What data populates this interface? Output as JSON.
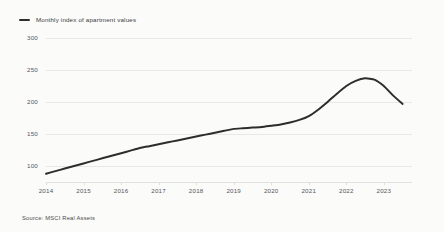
{
  "chart_data": {
    "type": "line",
    "title": "",
    "subtitle": "",
    "xlabel": "",
    "ylabel": "",
    "grid": true,
    "legend_position": "top-left",
    "legend": [
      "Monthly index of apartment values"
    ],
    "ylim": [
      75,
      300
    ],
    "yticks": [
      100,
      150,
      200,
      250,
      300
    ],
    "ytick_labels": [
      "100",
      "150",
      "200",
      "250",
      "300"
    ],
    "xlim": [
      2014,
      2023.75
    ],
    "xticks": [
      2014,
      2015,
      2016,
      2017,
      2018,
      2019,
      2020,
      2021,
      2022,
      2023
    ],
    "xtick_labels": [
      "2014",
      "2015",
      "2016",
      "2017",
      "2018",
      "2019",
      "2020",
      "2021",
      "2022",
      "2023"
    ],
    "series": [
      {
        "name": "Monthly index of apartment values",
        "color": "#2d2d2d",
        "x": [
          2014.0,
          2014.25,
          2014.5,
          2014.75,
          2015.0,
          2015.25,
          2015.5,
          2015.75,
          2016.0,
          2016.25,
          2016.5,
          2016.75,
          2017.0,
          2017.25,
          2017.5,
          2017.75,
          2018.0,
          2018.25,
          2018.5,
          2018.75,
          2019.0,
          2019.25,
          2019.5,
          2019.75,
          2020.0,
          2020.25,
          2020.5,
          2020.75,
          2021.0,
          2021.25,
          2021.5,
          2021.75,
          2022.0,
          2022.25,
          2022.5,
          2022.75,
          2023.0,
          2023.25,
          2023.5
        ],
        "values": [
          88,
          92,
          96,
          100,
          104,
          108,
          112,
          116,
          120,
          124,
          128,
          131,
          134,
          137,
          140,
          143,
          146,
          149,
          152,
          155,
          158,
          159,
          160,
          161,
          163,
          165,
          168,
          172,
          178,
          188,
          200,
          213,
          225,
          233,
          237,
          235,
          225,
          210,
          197
        ]
      }
    ]
  },
  "legend": {
    "marker": "line-marker",
    "label": "Monthly index of apartment values"
  },
  "footer": {
    "source": "Source: MSCI Real Assets"
  },
  "colors": {
    "line": "#2d2d2d",
    "grid": "#e9e8e6",
    "background": "#fbfbfa",
    "text": "#55565a"
  }
}
